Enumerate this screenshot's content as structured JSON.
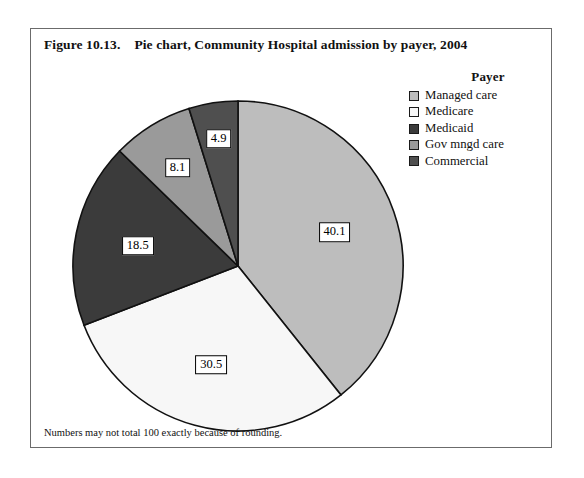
{
  "figure": {
    "number": "Figure 10.13.",
    "title": "Pie chart, Community Hospital admission by payer, 2004",
    "footnote": "Numbers may not total 100 exactly because of rounding."
  },
  "legend": {
    "title": "Payer",
    "entries": [
      {
        "label": "Managed care",
        "color": "#bdbdbd"
      },
      {
        "label": "Medicare",
        "color": "#f7f7f7"
      },
      {
        "label": "Medicaid",
        "color": "#3b3b3b"
      },
      {
        "label": "Gov mngd care",
        "color": "#9a9a9a"
      },
      {
        "label": "Commercial",
        "color": "#4f4f4f"
      }
    ]
  },
  "chart_data": {
    "type": "pie",
    "title": "Pie chart, Community Hospital admission by payer, 2004",
    "legend_title": "Payer",
    "legend_position": "right",
    "units": "percent",
    "start_angle_deg": 0,
    "direction": "clockwise",
    "categories": [
      "Managed care",
      "Medicare",
      "Medicaid",
      "Gov mngd care",
      "Commercial"
    ],
    "values": [
      40.1,
      30.5,
      18.5,
      8.1,
      4.9
    ],
    "labels": [
      "40.1",
      "30.5",
      "18.5",
      "8.1",
      "4.9"
    ],
    "colors": [
      "#bdbdbd",
      "#f7f7f7",
      "#3b3b3b",
      "#9a9a9a",
      "#4f4f4f"
    ],
    "total": 102.1,
    "note": "Numbers may not total 100 exactly because of rounding."
  }
}
